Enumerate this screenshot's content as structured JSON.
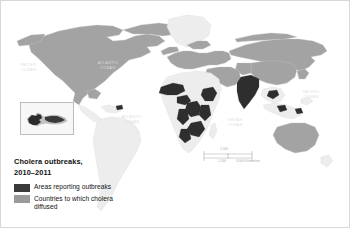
{
  "figure": {
    "kind": "thematic-world-map",
    "background_color": "#ffffff"
  },
  "legend": {
    "title": "Cholera outbreaks,\n2010–2011",
    "items": [
      {
        "label": "Areas reporting outbreaks",
        "color": "#3a3a3a",
        "swatch_name": "legend-swatch-outbreak"
      },
      {
        "label": "Countries to which cholera\ndiffused",
        "color": "#9a9a9a",
        "swatch_name": "legend-swatch-diffused"
      }
    ]
  },
  "map": {
    "land_default_color": "#ededed",
    "land_border_color": "#d5d5d5",
    "outbreak_color": "#2e2e2e",
    "diffused_color": "#a0a0a0",
    "ocean_color": "#ffffff",
    "ocean_label_color": "#dcdcdc",
    "ocean_labels": [
      {
        "name": "ocean-label-pacific-west",
        "text": "PACIFIC\nOCEAN",
        "x": 24,
        "y": 63
      },
      {
        "name": "ocean-label-atlantic-north",
        "text": "ATLANTIC\nOCEAN",
        "x": 104,
        "y": 61
      },
      {
        "name": "ocean-label-atlantic-south",
        "text": "ATLANTIC\nOCEAN",
        "x": 128,
        "y": 115
      },
      {
        "name": "ocean-label-indian",
        "text": "INDIAN\nOCEAN",
        "x": 232,
        "y": 118
      },
      {
        "name": "ocean-label-pacific-east",
        "text": "PACIFIC\nOCEAN",
        "x": 308,
        "y": 90
      }
    ]
  },
  "inset": {
    "name": "hispaniola-inset",
    "border_color": "#bdbdbd",
    "background_color": "#f7f7f7",
    "land_color": "#c8c8c8",
    "outbreak_color": "#2e2e2e"
  },
  "scale_bar": {
    "name": "map-scale-bar",
    "top_unit_label": "1,500",
    "top_unit_zero": "0",
    "bottom_left_label": "1,500",
    "bottom_right_label": "3,000 Kilometers",
    "bottom_zero": "0",
    "tick_color": "#9a9a9a",
    "text_color": "#a5a5a5"
  }
}
